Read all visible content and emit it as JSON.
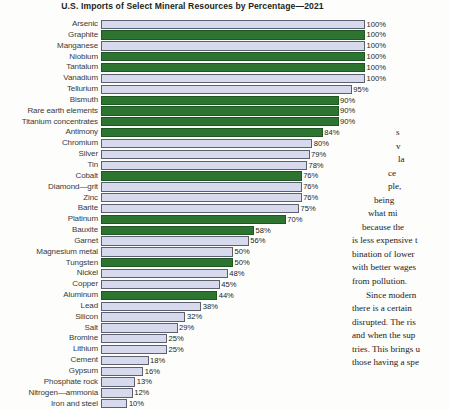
{
  "figure": {
    "title": "U.S. Imports of Select Mineral Resources by Percentage—2021"
  },
  "chart_data": {
    "type": "bar",
    "orientation": "horizontal",
    "title": "U.S. Imports of Select Mineral Resources by Percentage—2021",
    "xlabel": "",
    "ylabel": "",
    "xlim": [
      0,
      100
    ],
    "grid": false,
    "legend": null,
    "value_suffix": "%",
    "colors": {
      "green": "#2c7430",
      "light": "#d6daec",
      "border": "#5c5f70"
    },
    "categories": [
      "Arsenic",
      "Graphite",
      "Manganese",
      "Niobium",
      "Tantalum",
      "Vanadium",
      "Tellurium",
      "Bismuth",
      "Rare earth elements",
      "Titanium concentrates",
      "Antimony",
      "Chromium",
      "Silver",
      "Tin",
      "Cobalt",
      "Diamond—grit",
      "Zinc",
      "Barite",
      "Platinum",
      "Bauxite",
      "Garnet",
      "Magnesium metal",
      "Tungsten",
      "Nickel",
      "Copper",
      "Aluminum",
      "Lead",
      "Silicon",
      "Salt",
      "Bromine",
      "Lithium",
      "Cement",
      "Gypsum",
      "Phosphate rock",
      "Nitrogen—ammonia",
      "Iron and steel"
    ],
    "values": [
      100,
      100,
      100,
      100,
      100,
      100,
      95,
      90,
      90,
      90,
      84,
      80,
      79,
      78,
      76,
      76,
      76,
      75,
      70,
      58,
      56,
      50,
      50,
      48,
      45,
      44,
      38,
      32,
      29,
      25,
      25,
      18,
      16,
      13,
      12,
      10
    ],
    "value_labels": [
      "100%",
      "100%",
      "100%",
      "100%",
      "100%",
      "100%",
      "95%",
      "90%",
      "90%",
      "90%",
      "84%",
      "80%",
      "79%",
      "78%",
      "76%",
      "76%",
      "76%",
      "75%",
      "70%",
      "58%",
      "56%",
      "50%",
      "50%",
      "48%",
      "45%",
      "44%",
      "38%",
      "32%",
      "29%",
      "25%",
      "25%",
      "18%",
      "16%",
      "13%",
      "12%",
      "10%"
    ],
    "bar_colors": [
      "light",
      "green",
      "light",
      "green",
      "green",
      "light",
      "light",
      "green",
      "green",
      "green",
      "green",
      "light",
      "light",
      "light",
      "green",
      "light",
      "light",
      "light",
      "green",
      "green",
      "light",
      "light",
      "green",
      "light",
      "light",
      "green",
      "light",
      "light",
      "light",
      "light",
      "light",
      "light",
      "light",
      "light",
      "light",
      "light"
    ]
  },
  "body_text": {
    "lines": [
      "s",
      "v",
      "la",
      "ce",
      "ple,",
      "being",
      "what  mi",
      "because the",
      "is less expensive t",
      "bination of lower",
      "with  better  wages",
      "from pollution.",
      "Since modern",
      "there is a certain",
      "disrupted. The ris",
      "and  when  the  sup",
      "tries. This brings u",
      "those having a spe"
    ]
  }
}
